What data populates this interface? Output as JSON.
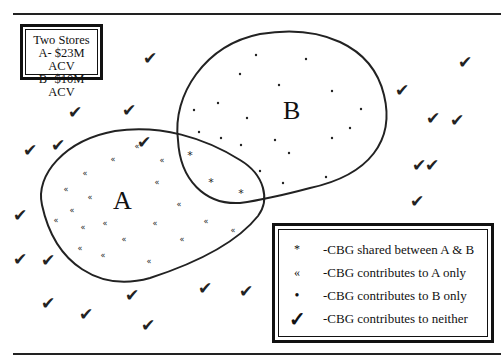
{
  "title_box": {
    "line1": "Two Stores",
    "line2": "A- $23M ACV",
    "line3": "B- $10M ACV"
  },
  "regions": {
    "a_label": "A",
    "b_label": "B"
  },
  "legend": {
    "items": [
      {
        "symbol": "*",
        "label": "-CBG shared between A & B"
      },
      {
        "symbol": "«",
        "label": "-CBG contributes to A only"
      },
      {
        "symbol": "•",
        "label": "-CBG contributes to B only"
      },
      {
        "symbol": "✓",
        "label": "-CBG contributes to neither"
      }
    ]
  },
  "markers": {
    "shared": [
      [
        190,
        155
      ],
      [
        211,
        182
      ],
      [
        241,
        193
      ]
    ],
    "a_only": [
      [
        137,
        146
      ],
      [
        113,
        159
      ],
      [
        162,
        160
      ],
      [
        85,
        173
      ],
      [
        157,
        182
      ],
      [
        66,
        189
      ],
      [
        90,
        197
      ],
      [
        179,
        204
      ],
      [
        72,
        210
      ],
      [
        56,
        220
      ],
      [
        83,
        227
      ],
      [
        105,
        223
      ],
      [
        155,
        223
      ],
      [
        206,
        221
      ],
      [
        233,
        230
      ],
      [
        124,
        239
      ],
      [
        182,
        239
      ],
      [
        80,
        248
      ],
      [
        103,
        255
      ],
      [
        149,
        261
      ]
    ],
    "b_only": [
      [
        256,
        55
      ],
      [
        306,
        59
      ],
      [
        240,
        74
      ],
      [
        279,
        85
      ],
      [
        332,
        91
      ],
      [
        218,
        103
      ],
      [
        194,
        110
      ],
      [
        247,
        118
      ],
      [
        361,
        109
      ],
      [
        350,
        128
      ],
      [
        199,
        132
      ],
      [
        221,
        138
      ],
      [
        275,
        140
      ],
      [
        332,
        138
      ],
      [
        241,
        145
      ],
      [
        289,
        153
      ],
      [
        260,
        171
      ],
      [
        326,
        177
      ],
      [
        283,
        183
      ]
    ],
    "neither": [
      [
        150,
        58
      ],
      [
        465,
        62
      ],
      [
        75,
        112
      ],
      [
        129,
        110
      ],
      [
        144,
        142
      ],
      [
        402,
        90
      ],
      [
        433,
        118
      ],
      [
        30,
        150
      ],
      [
        58,
        145
      ],
      [
        457,
        120
      ],
      [
        432,
        165
      ],
      [
        419,
        165
      ],
      [
        417,
        201
      ],
      [
        20,
        215
      ],
      [
        20,
        259
      ],
      [
        48,
        260
      ],
      [
        48,
        303
      ],
      [
        86,
        314
      ],
      [
        148,
        325
      ],
      [
        132,
        295
      ],
      [
        205,
        288
      ],
      [
        246,
        291
      ]
    ]
  }
}
